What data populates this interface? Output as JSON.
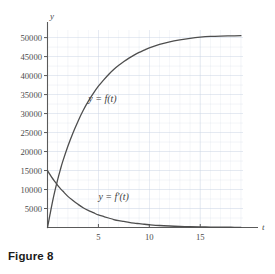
{
  "figure": {
    "caption": "Figure 8"
  },
  "chart_data": {
    "type": "line",
    "title": "",
    "xlabel": "t",
    "ylabel": "y",
    "xlim": [
      0,
      19.2
    ],
    "ylim": [
      0,
      52000
    ],
    "grid": true,
    "grid_color": "#c9d4e4",
    "axis_color": "#5a5a5a",
    "curve_color": "#4e4e4e",
    "legend": "inline-labels",
    "x_ticks": [
      5,
      10,
      15
    ],
    "x_tick_labels": [
      "5",
      "10",
      "15"
    ],
    "y_ticks": [
      5000,
      10000,
      15000,
      20000,
      25000,
      30000,
      35000,
      40000,
      45000,
      50000
    ],
    "y_tick_labels": [
      "5000",
      "10000",
      "15000",
      "20000",
      "25000",
      "30000",
      "35000",
      "40000",
      "45000",
      "50000"
    ],
    "series": [
      {
        "name": "y = f(t)",
        "label": "y = f(t)",
        "label_x": 4.0,
        "label_y": 33000,
        "x": [
          0,
          0.25,
          0.5,
          0.75,
          1,
          1.25,
          1.5,
          2,
          2.5,
          3,
          3.5,
          4,
          4.5,
          5,
          5.5,
          6,
          6.5,
          7,
          7.5,
          8,
          8.5,
          9,
          9.5,
          10,
          11,
          12,
          13,
          14,
          15,
          16,
          17,
          18,
          19
        ],
        "y": [
          0,
          3500,
          6900,
          9900,
          12600,
          15100,
          17400,
          21400,
          24900,
          28000,
          30800,
          33200,
          35300,
          37200,
          38800,
          40300,
          41600,
          42700,
          43700,
          44600,
          45400,
          46100,
          46700,
          47300,
          48200,
          48900,
          49400,
          49800,
          50100,
          50300,
          50400,
          50450,
          50500
        ]
      },
      {
        "name": "y = f'(t)",
        "label": "y = f'(t)",
        "label_x": 5.0,
        "label_y": 7200,
        "x": [
          0,
          0.25,
          0.5,
          0.75,
          1,
          1.25,
          1.5,
          2,
          2.5,
          3,
          3.5,
          4,
          4.5,
          5,
          5.5,
          6,
          6.5,
          7,
          7.5,
          8,
          8.5,
          9,
          9.5,
          10,
          11,
          12,
          13,
          14,
          15,
          16,
          17,
          18,
          19
        ],
        "y": [
          15000,
          13900,
          12900,
          12000,
          11100,
          10300,
          9600,
          8200,
          7100,
          6100,
          5200,
          4500,
          3900,
          3300,
          2900,
          2500,
          2100,
          1800,
          1600,
          1350,
          1150,
          1000,
          850,
          730,
          530,
          390,
          280,
          200,
          150,
          110,
          80,
          60,
          40
        ]
      }
    ]
  }
}
